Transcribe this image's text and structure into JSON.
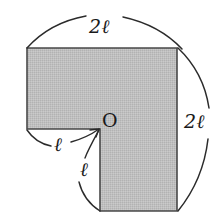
{
  "figure": {
    "shape": {
      "name": "L-shape",
      "fill_color": "#bdbdbd",
      "stroke_color": "#4a4a4a",
      "background_color": "#ffffff",
      "vertices": [
        {
          "x": 27,
          "y": 48
        },
        {
          "x": 177,
          "y": 48
        },
        {
          "x": 177,
          "y": 211
        },
        {
          "x": 100,
          "y": 211
        },
        {
          "x": 100,
          "y": 129
        },
        {
          "x": 27,
          "y": 129
        }
      ],
      "origin_point": {
        "x": 100,
        "y": 129
      }
    },
    "labels": {
      "top": {
        "num": "2",
        "sym": "ℓ",
        "full": "2ℓ"
      },
      "right": {
        "num": "2",
        "sym": "ℓ",
        "full": "2ℓ"
      },
      "left": {
        "num": "",
        "sym": "ℓ",
        "full": "ℓ"
      },
      "lower": {
        "num": "",
        "sym": "ℓ",
        "full": "ℓ"
      },
      "origin": "O"
    },
    "arcs": {
      "top_left_label": "2ℓ",
      "right_label": "2ℓ",
      "left_notch_label": "ℓ",
      "lower_notch_label": "ℓ"
    }
  }
}
